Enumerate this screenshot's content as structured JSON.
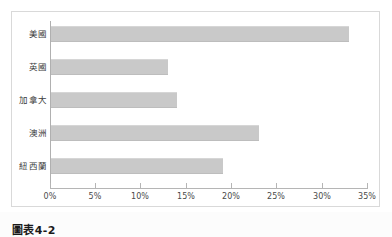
{
  "figure": {
    "caption": "圖表4-2",
    "frame_border_color": "#d9d9d9",
    "bar_color": "#c9c9c9",
    "axis_color": "#b5b5b5",
    "text_color": "#3c3c3c"
  },
  "chart_data": {
    "type": "bar",
    "orientation": "horizontal",
    "title": "",
    "subtitle": "",
    "xlabel": "",
    "ylabel": "",
    "categories": [
      "美國",
      "英國",
      "加拿大",
      "澳洲",
      "紐西蘭"
    ],
    "values": [
      33,
      13,
      14,
      23,
      19
    ],
    "value_suffix": "%",
    "xlim": [
      0,
      35
    ],
    "xticks": [
      0,
      5,
      10,
      15,
      20,
      25,
      30,
      35
    ],
    "xtick_labels": [
      "0%",
      "5%",
      "10%",
      "15%",
      "20%",
      "25%",
      "30%",
      "35%"
    ],
    "grid": false,
    "legend": false,
    "legend_position": "none",
    "series": [
      {
        "name": "",
        "values": [
          33,
          13,
          14,
          23,
          19
        ]
      }
    ]
  }
}
